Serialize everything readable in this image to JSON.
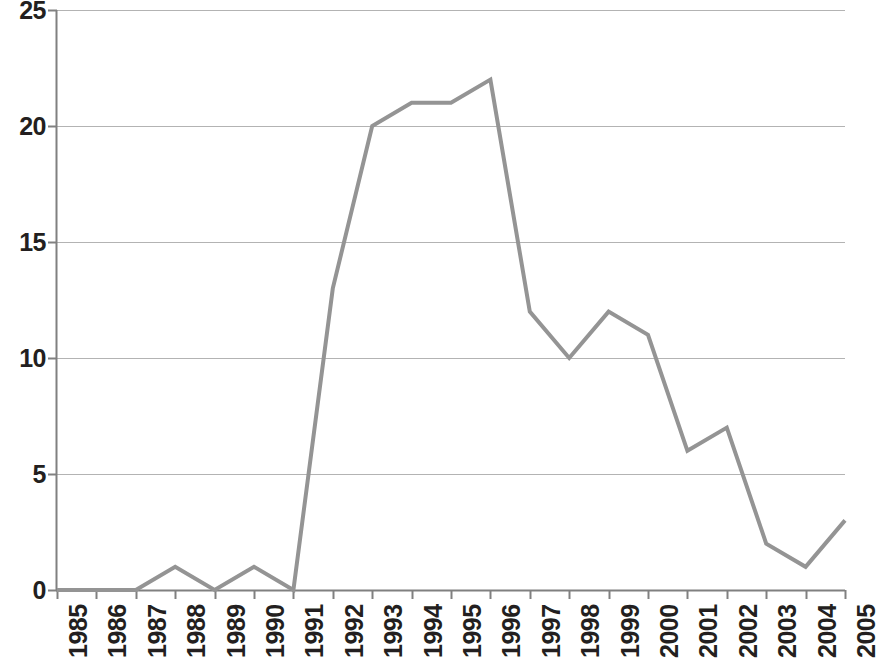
{
  "chart_data": {
    "type": "line",
    "title": "",
    "subtitle": "",
    "xlabel": "",
    "ylabel": "",
    "categories": [
      "1985",
      "1986",
      "1987",
      "1988",
      "1989",
      "1990",
      "1991",
      "1992",
      "1993",
      "1994",
      "1995",
      "1996",
      "1997",
      "1998",
      "1999",
      "2000",
      "2001",
      "2002",
      "2003",
      "2004",
      "2005"
    ],
    "x": [
      1985,
      1986,
      1987,
      1988,
      1989,
      1990,
      1991,
      1992,
      1993,
      1994,
      1995,
      1996,
      1997,
      1998,
      1999,
      2000,
      2001,
      2002,
      2003,
      2004,
      2005
    ],
    "values": [
      0,
      0,
      0,
      1,
      0,
      1,
      0,
      13,
      20,
      21,
      21,
      22,
      12,
      10,
      12,
      11,
      6,
      7,
      2,
      1,
      3
    ],
    "series": [
      {
        "name": "",
        "values": [
          0,
          0,
          0,
          1,
          0,
          1,
          0,
          13,
          20,
          21,
          21,
          22,
          12,
          10,
          12,
          11,
          6,
          7,
          2,
          1,
          3
        ],
        "color": "#949494"
      }
    ],
    "ylim": [
      0,
      25
    ],
    "y_ticks": [
      0,
      5,
      10,
      15,
      20,
      25
    ],
    "y_tick_labels": [
      "0",
      "5",
      "10",
      "15",
      "20",
      "25"
    ],
    "xlim": [
      1985,
      2005
    ],
    "grid": true,
    "grid_axis": "y",
    "grid_color": "#b3b3b3",
    "legend": false,
    "legend_position": "none",
    "line_color": "#949494",
    "line_width": 4,
    "markers": false,
    "background_color": "#ffffff",
    "axis_color": "#808080",
    "label_color": "#231f20",
    "x_label_rotation": -90,
    "annotations": []
  }
}
